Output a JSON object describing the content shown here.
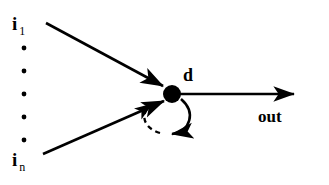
{
  "diagram": {
    "type": "node-with-self-loop",
    "background_color": "#ffffff",
    "stroke_color": "#000000",
    "node": {
      "name": "central-node",
      "label": "d",
      "shape": "filled-circle",
      "cx": 172,
      "cy": 94,
      "r": 9,
      "fill": "#000000"
    },
    "inputs": [
      {
        "id": "input-first",
        "label_main": "i",
        "label_sub": "1",
        "arrow_from": [
          46,
          23
        ],
        "arrow_to": [
          166,
          88
        ]
      },
      {
        "id": "input-last",
        "label_main": "i",
        "label_sub": "n",
        "arrow_from": [
          43,
          154
        ],
        "arrow_to": [
          166,
          101
        ]
      }
    ],
    "vertical_ellipsis": {
      "name": "input-ellipsis-dots",
      "count": 5,
      "x": 24,
      "ys": [
        48,
        71,
        94,
        117,
        140
      ],
      "radius": 2.3
    },
    "output": {
      "id": "output-arrow",
      "label": "out",
      "arrow_from": [
        182,
        94
      ],
      "arrow_to": [
        297,
        94
      ]
    },
    "self_loop": {
      "id": "feedback-self-loop",
      "solid_segment": "clockwise arc from node right side down to bottom with arrowhead",
      "dashed_segment": "arc from bottom-left back up to node with arrowhead",
      "dash_pattern": "5,4"
    }
  }
}
